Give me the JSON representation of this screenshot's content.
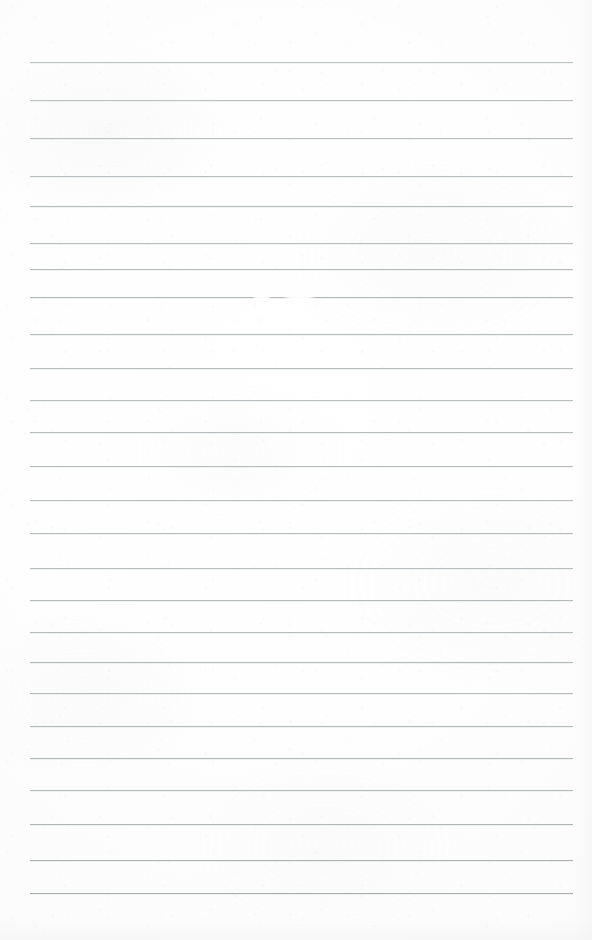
{
  "document": {
    "kind": "scanned-ruled-notepad-page",
    "title": "Blank Ruled Notepad Page",
    "page_width": 592,
    "page_height": 940,
    "content_text": "",
    "handwriting_present": "no",
    "printed_text_present": "no"
  },
  "colors": {
    "paper": "#fdfdfd",
    "paper_shade": "#f7f7f8",
    "rule_line": "#b9bcbe",
    "rule_line_light": "#c9cccf",
    "rule_line_dark": "#a9acaf"
  },
  "ruling": {
    "line_count": 23,
    "first_line_y": 62,
    "line_spacing": 37.8,
    "line_left_x": 30,
    "line_right_x": 573,
    "line_thickness": 1,
    "orientation": "horizontal",
    "top_margin": 62,
    "bottom_margin": 47,
    "left_margin": 30,
    "right_margin": 19
  },
  "lines": [
    {
      "index": 1,
      "y": 62,
      "x1": 30,
      "x2": 573,
      "shade": "#c0c3c5"
    },
    {
      "index": 2,
      "y": 100,
      "x1": 30,
      "x2": 573,
      "shade": "#bdc0c3"
    },
    {
      "index": 3,
      "y": 138,
      "x1": 30,
      "x2": 573,
      "shade": "#babdc0"
    },
    {
      "index": 4,
      "y": 176,
      "x1": 30,
      "x2": 573,
      "shade": "#bcbfc2"
    },
    {
      "index": 5,
      "y": 206,
      "x1": 30,
      "x2": 573,
      "shade": "#b7babd"
    },
    {
      "index": 6,
      "y": 243,
      "x1": 30,
      "x2": 573,
      "shade": "#b9bcbf"
    },
    {
      "index": 7,
      "y": 269,
      "x1": 30,
      "x2": 573,
      "shade": "#b5b8bb"
    },
    {
      "index": 8,
      "y": 297,
      "x1": 30,
      "x2": 573,
      "shade": "#b3b6b9"
    },
    {
      "index": 9,
      "y": 334,
      "x1": 30,
      "x2": 573,
      "shade": "#b8bbbe"
    },
    {
      "index": 10,
      "y": 368,
      "x1": 30,
      "x2": 573,
      "shade": "#babdc0"
    },
    {
      "index": 11,
      "y": 400,
      "x1": 30,
      "x2": 573,
      "shade": "#bcbfc2"
    },
    {
      "index": 12,
      "y": 432,
      "x1": 30,
      "x2": 573,
      "shade": "#b9bcbf"
    },
    {
      "index": 13,
      "y": 466,
      "x1": 30,
      "x2": 573,
      "shade": "#b7babd"
    },
    {
      "index": 14,
      "y": 500,
      "x1": 30,
      "x2": 573,
      "shade": "#babdc0"
    },
    {
      "index": 15,
      "y": 533,
      "x1": 30,
      "x2": 573,
      "shade": "#b8bbbe"
    },
    {
      "index": 16,
      "y": 568,
      "x1": 30,
      "x2": 573,
      "shade": "#bbbec1"
    },
    {
      "index": 17,
      "y": 600,
      "x1": 30,
      "x2": 573,
      "shade": "#b6b9bc"
    },
    {
      "index": 18,
      "y": 632,
      "x1": 30,
      "x2": 573,
      "shade": "#b9bcbf"
    },
    {
      "index": 19,
      "y": 662,
      "x1": 30,
      "x2": 573,
      "shade": "#b4b7ba"
    },
    {
      "index": 20,
      "y": 693,
      "x1": 30,
      "x2": 573,
      "shade": "#b7babd"
    },
    {
      "index": 21,
      "y": 726,
      "x1": 30,
      "x2": 573,
      "shade": "#b5b8bb"
    },
    {
      "index": 22,
      "y": 758,
      "x1": 30,
      "x2": 573,
      "shade": "#b3b6b9"
    },
    {
      "index": 23,
      "y": 790,
      "x1": 30,
      "x2": 573,
      "shade": "#b6b9bc"
    },
    {
      "index": 24,
      "y": 824,
      "x1": 30,
      "x2": 573,
      "shade": "#b4b7ba"
    },
    {
      "index": 25,
      "y": 860,
      "x1": 30,
      "x2": 573,
      "shade": "#aeb1b4"
    },
    {
      "index": 26,
      "y": 893,
      "x1": 30,
      "x2": 573,
      "shade": "#a9acaf"
    }
  ],
  "artifacts": [
    {
      "name": "line-break-patch",
      "type": "faint-gap",
      "x": 282,
      "y": 296,
      "width": 34,
      "height": 3
    },
    {
      "name": "line-break-patch-secondary",
      "type": "faint-gap",
      "x": 252,
      "y": 296,
      "width": 20,
      "height": 3
    }
  ]
}
